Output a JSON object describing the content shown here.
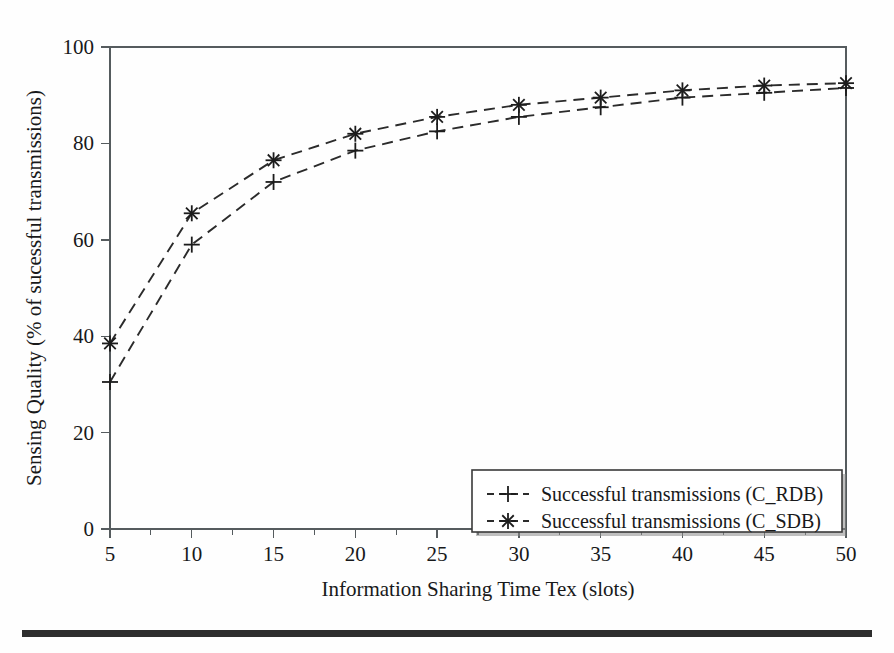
{
  "figure": {
    "background_color": "#fefefe",
    "axis_color": "#555b5e",
    "line_color": "#2b2b2b"
  },
  "axes": {
    "x_title": "Information Sharing Time Tex (slots)",
    "y_title": "Sensing Quality (% of sucessful transmissions)",
    "x_ticklabels": [
      "5",
      "10",
      "15",
      "20",
      "25",
      "30",
      "35",
      "40",
      "45",
      "50"
    ],
    "y_ticklabels": [
      "0",
      "20",
      "40",
      "60",
      "80",
      "100"
    ]
  },
  "legend": {
    "entries": [
      {
        "label": "Successful transmissions (C_RDB)",
        "marker": "plus-marker"
      },
      {
        "label": "Successful transmissions (C_SDB)",
        "marker": "asterisk-marker"
      }
    ]
  },
  "chart_data": {
    "type": "line",
    "title": "",
    "xlabel": "Information Sharing Time Tex (slots)",
    "ylabel": "Sensing Quality (% of sucessful transmissions)",
    "x": [
      5,
      10,
      15,
      20,
      25,
      30,
      35,
      40,
      45,
      50
    ],
    "xlim": [
      5,
      50
    ],
    "ylim": [
      0,
      100
    ],
    "xticks": [
      5,
      10,
      15,
      20,
      25,
      30,
      35,
      40,
      45,
      50
    ],
    "yticks": [
      0,
      20,
      40,
      60,
      80,
      100
    ],
    "grid": false,
    "legend_position": "lower right",
    "series": [
      {
        "name": "Successful transmissions (C_RDB)",
        "marker": "plus",
        "linestyle": "dashed",
        "color": "#2b2b2b",
        "values": [
          30.5,
          59.0,
          72.0,
          78.5,
          82.5,
          85.5,
          87.5,
          89.5,
          90.5,
          91.5
        ]
      },
      {
        "name": "Successful transmissions (C_SDB)",
        "marker": "asterisk",
        "linestyle": "dashed",
        "color": "#2b2b2b",
        "values": [
          38.5,
          65.5,
          76.5,
          82.0,
          85.5,
          88.0,
          89.5,
          91.0,
          92.0,
          92.5
        ]
      }
    ]
  }
}
